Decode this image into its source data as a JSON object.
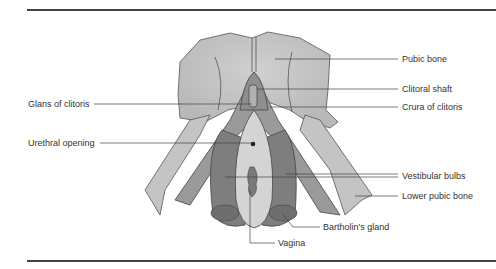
{
  "diagram": {
    "labels_right": [
      {
        "id": "pubic-bone",
        "text": "Pubic bone"
      },
      {
        "id": "clitoral-shaft",
        "text": "Clitoral shaft"
      },
      {
        "id": "crura-of-clitoris",
        "text": "Crura of clitoris"
      },
      {
        "id": "vestibular-bulbs",
        "text": "Vestibular bulbs"
      },
      {
        "id": "lower-pubic-bone",
        "text": "Lower pubic bone"
      }
    ],
    "labels_left": [
      {
        "id": "glans-of-clitoris",
        "text": "Glans of clitoris"
      },
      {
        "id": "urethral-opening",
        "text": "Urethral opening"
      }
    ],
    "labels_bottom": [
      {
        "id": "bartholins-gland",
        "text": "Bartholin's gland"
      },
      {
        "id": "vagina",
        "text": "Vagina"
      }
    ],
    "colors": {
      "bone": "#c8c8c8",
      "tissue_dark": "#8a8a8a",
      "tissue_mid": "#a5a5a5",
      "vestibule": "#d4d4d4",
      "line": "#444444"
    }
  }
}
